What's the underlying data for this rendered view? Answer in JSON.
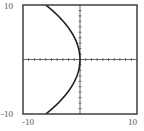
{
  "chart_data": {
    "type": "line",
    "title": "",
    "xlabel": "",
    "ylabel": "",
    "xlim": [
      -10,
      10
    ],
    "ylim": [
      -10,
      10
    ],
    "x_tick_labels": [
      "-10",
      "10"
    ],
    "y_tick_labels": [
      "10",
      "-10"
    ],
    "tick_step": 1,
    "grid": false,
    "legend": null,
    "series": [
      {
        "name": "x = -0.06 y^2",
        "description": "Sideways parabola opening left with vertex at origin",
        "y": [
          -10,
          -8,
          -6,
          -4,
          -2,
          0,
          2,
          4,
          6,
          8,
          10
        ],
        "x": [
          -6,
          -3.84,
          -2.16,
          -0.96,
          -0.24,
          0,
          -0.24,
          -0.96,
          -2.16,
          -3.84,
          -6
        ]
      }
    ]
  },
  "labels": {
    "y_max": "10",
    "y_min": "-10",
    "x_min": "-10",
    "x_max": "10"
  },
  "colors": {
    "frame": "#333333",
    "curve": "#222222",
    "axes": "#444444"
  }
}
